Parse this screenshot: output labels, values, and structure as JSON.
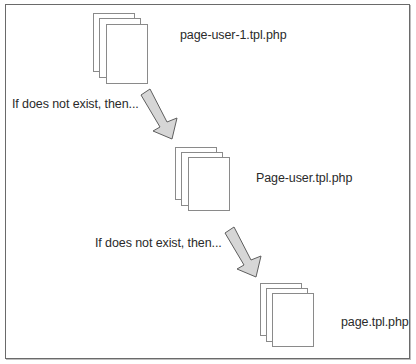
{
  "diagram": {
    "type": "template-fallback-flow",
    "nodes": [
      {
        "id": "n1",
        "label": "page-user-1.tpl.php",
        "icon": "document-stack-icon"
      },
      {
        "id": "n2",
        "label": "Page-user.tpl.php",
        "icon": "document-stack-icon"
      },
      {
        "id": "n3",
        "label": "page.tpl.php",
        "icon": "document-stack-icon"
      }
    ],
    "edges": [
      {
        "from": "n1",
        "to": "n2",
        "label": "If does not exist, then...",
        "icon": "arrow-down-right-icon"
      },
      {
        "from": "n2",
        "to": "n3",
        "label": "If does not exist, then...",
        "icon": "arrow-down-right-icon"
      }
    ]
  },
  "colors": {
    "frame": "#6a6a6a",
    "page_stroke": "#8a8a8a",
    "arrow_fill": "#d6d6d6",
    "arrow_stroke": "#5e5e5e",
    "text": "#2a2a2a"
  }
}
